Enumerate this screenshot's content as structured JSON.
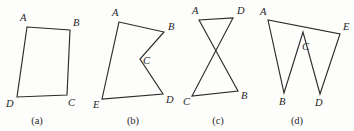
{
  "sheet": {
    "title": "Four polygon diagrams",
    "background_color": "#fdfdfb",
    "stroke_color": "#2b2b2b",
    "label_color": "#242424",
    "width": 354,
    "height": 131
  },
  "figures": [
    {
      "id": "a",
      "caption": "(a)",
      "caption_x": 37,
      "caption_y": 124,
      "shape": "quadrilateral",
      "closed": true,
      "path": "27,27 70,30 67,95 17,97",
      "vertices": [
        {
          "name": "A",
          "x": 27,
          "y": 27,
          "label_x": 20,
          "label_y": 21
        },
        {
          "name": "B",
          "x": 70,
          "y": 30,
          "label_x": 73,
          "label_y": 26
        },
        {
          "name": "C",
          "x": 67,
          "y": 95,
          "label_x": 68,
          "label_y": 106
        },
        {
          "name": "D",
          "x": 17,
          "y": 97,
          "label_x": 6,
          "label_y": 107
        }
      ]
    },
    {
      "id": "b",
      "caption": "(b)",
      "caption_x": 133,
      "caption_y": 124,
      "shape": "concave-pentagon",
      "closed": true,
      "path": "119,22 164,32 140,59 163,94 102,99",
      "vertices": [
        {
          "name": "A",
          "x": 119,
          "y": 22,
          "label_x": 112,
          "label_y": 16
        },
        {
          "name": "B",
          "x": 164,
          "y": 32,
          "label_x": 168,
          "label_y": 30
        },
        {
          "name": "C",
          "x": 140,
          "y": 59,
          "label_x": 143,
          "label_y": 64
        },
        {
          "name": "D",
          "x": 163,
          "y": 94,
          "label_x": 166,
          "label_y": 103
        },
        {
          "name": "E",
          "x": 102,
          "y": 99,
          "label_x": 93,
          "label_y": 108
        }
      ]
    },
    {
      "id": "c",
      "caption": "(c)",
      "caption_x": 218,
      "caption_y": 124,
      "shape": "self-intersecting-bowtie",
      "closed": true,
      "path": "199,20 238,91 192,96 233,18",
      "vertices": [
        {
          "name": "A",
          "x": 199,
          "y": 20,
          "label_x": 192,
          "label_y": 14
        },
        {
          "name": "D",
          "x": 233,
          "y": 18,
          "label_x": 237,
          "label_y": 14
        },
        {
          "name": "B",
          "x": 238,
          "y": 91,
          "label_x": 241,
          "label_y": 99
        },
        {
          "name": "C",
          "x": 192,
          "y": 96,
          "label_x": 183,
          "label_y": 105
        }
      ]
    },
    {
      "id": "d",
      "caption": "(d)",
      "caption_x": 297,
      "caption_y": 124,
      "shape": "zigzag-pentagon",
      "closed": true,
      "path": "268,20 284,93 303,32 320,94 340,34",
      "vertices": [
        {
          "name": "A",
          "x": 268,
          "y": 20,
          "label_x": 260,
          "label_y": 15
        },
        {
          "name": "B",
          "x": 284,
          "y": 93,
          "label_x": 279,
          "label_y": 105
        },
        {
          "name": "C",
          "x": 303,
          "y": 32,
          "label_x": 302,
          "label_y": 50
        },
        {
          "name": "D",
          "x": 320,
          "y": 94,
          "label_x": 315,
          "label_y": 106
        },
        {
          "name": "E",
          "x": 340,
          "y": 34,
          "label_x": 343,
          "label_y": 30
        }
      ]
    }
  ]
}
